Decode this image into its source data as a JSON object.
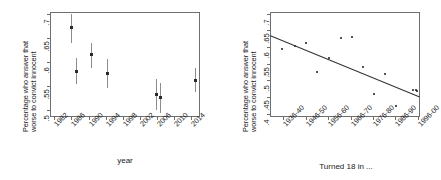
{
  "figure": {
    "title": "",
    "panels": [
      "left",
      "right"
    ]
  },
  "chart_data": [
    {
      "id": "left",
      "type": "scatter",
      "title": "",
      "xlabel": "year",
      "ylabel_line1": "Percentage who answer that",
      "ylabel_line2": "worse to convict innocent",
      "xlim": [
        1981,
        2016
      ],
      "ylim": [
        0.485,
        0.705
      ],
      "xticks": [
        "1982",
        "1986",
        "1990",
        "1994",
        "1998",
        "2002",
        "2006",
        "2010",
        "2014"
      ],
      "xtickvals": [
        1982,
        1986,
        1990,
        1994,
        1998,
        2002,
        2006,
        2010,
        2014
      ],
      "yticks": [
        ".5",
        ".55",
        ".6",
        ".65",
        ".7"
      ],
      "ytickvals": [
        0.5,
        0.55,
        0.6,
        0.65,
        0.7
      ],
      "grid": false,
      "legend": "none",
      "error_bars": true,
      "points": [
        {
          "x": 1986.0,
          "y": 0.672,
          "lo": 0.64,
          "hi": 0.7
        },
        {
          "x": 1987.0,
          "y": 0.58,
          "lo": 0.554,
          "hi": 0.609
        },
        {
          "x": 1990.6,
          "y": 0.616,
          "lo": 0.588,
          "hi": 0.641
        },
        {
          "x": 1994.2,
          "y": 0.577,
          "lo": 0.546,
          "hi": 0.607
        },
        {
          "x": 2005.8,
          "y": 0.532,
          "lo": 0.5,
          "hi": 0.564
        },
        {
          "x": 2006.6,
          "y": 0.525,
          "lo": 0.494,
          "hi": 0.557
        },
        {
          "x": 2014.8,
          "y": 0.562,
          "lo": 0.538,
          "hi": 0.587
        }
      ]
    },
    {
      "id": "right",
      "type": "scatter",
      "title": "",
      "xlabel": "Turned 18 in ...",
      "ylabel_line1": "Percentage who answer that",
      "ylabel_line2": "worse to convict innocent",
      "xlim": [
        0.4,
        7.1
      ],
      "ylim": [
        0.39,
        0.705
      ],
      "xticks": [
        "1936-40",
        "1946-50",
        "1956-60",
        "1966-70",
        "1976-80",
        "1986-90",
        "1996-00"
      ],
      "xtickvals": [
        1,
        2,
        3,
        4,
        5,
        6,
        7
      ],
      "yticks": [
        ".4",
        ".45",
        ".5",
        ".55",
        ".6",
        ".65",
        ".7"
      ],
      "ytickvals": [
        0.4,
        0.45,
        0.5,
        0.55,
        0.6,
        0.65,
        0.7
      ],
      "grid": false,
      "legend": "none",
      "error_bars": false,
      "points": [
        {
          "x": 0.95,
          "y": 0.595
        },
        {
          "x": 1.52,
          "y": 0.603
        },
        {
          "x": 2.02,
          "y": 0.612
        },
        {
          "x": 2.52,
          "y": 0.524
        },
        {
          "x": 3.04,
          "y": 0.566
        },
        {
          "x": 3.55,
          "y": 0.627
        },
        {
          "x": 4.06,
          "y": 0.631
        },
        {
          "x": 4.55,
          "y": 0.541
        },
        {
          "x": 5.05,
          "y": 0.46
        },
        {
          "x": 5.55,
          "y": 0.518
        },
        {
          "x": 6.05,
          "y": 0.422
        },
        {
          "x": 6.8,
          "y": 0.47
        },
        {
          "x": 6.9,
          "y": 0.47
        },
        {
          "x": 6.98,
          "y": 0.468
        }
      ],
      "fit_line": {
        "x1": 0.4,
        "y1": 0.637,
        "x2": 7.1,
        "y2": 0.452
      }
    }
  ]
}
